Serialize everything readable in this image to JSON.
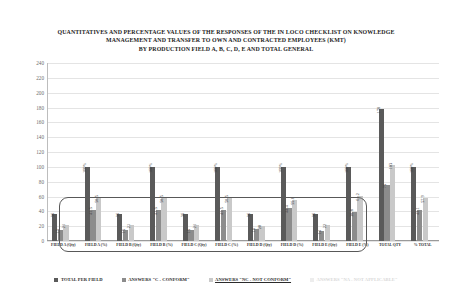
{
  "title": {
    "line1": "QUANTITATIVES AND PERCENTAGE VALUES OF THE RESPONSES OF THE IN LOCO CHECKLIST ON KNOWLEDGE",
    "line2": "MANAGEMENT AND TRANSFER TO OWN AND CONTRACTED EMPLOYEES (KMT)",
    "line3": "BY PRODUCTION FIELD A, B, C, D, E AND TOTAL GENERAL"
  },
  "colors": {
    "total_per_field": "#5a5a5a",
    "conform": "#8c8c8c",
    "not_conform": "#c9c9c9",
    "percent_applicable": "#ededed",
    "gridline": "#e4e4e4",
    "axis": "#9a9a9a",
    "annotation_border": "#585858"
  },
  "chart_data": {
    "type": "bar",
    "xlabel": "",
    "ylabel": "",
    "ylim": [
      0,
      240
    ],
    "yticks": [
      0,
      20,
      40,
      60,
      80,
      100,
      120,
      140,
      160,
      180,
      200,
      220,
      240
    ],
    "grid": true,
    "legend_position": "bottom",
    "categories": [
      "FIELD A (Qty)",
      "FIELD A (%)",
      "FIELD B (Qty)",
      "FIELD B (%)",
      "FIELD C (Qty)",
      "FIELD C (%)",
      "FIELD D (Qty)",
      "FIELD D (%)",
      "FIELD E (Qty)",
      "FIELD E (%)",
      "TOTAL QTY",
      "% TOTAL"
    ],
    "series": [
      {
        "name": "TOTAL PER FIELD",
        "color": "#5a5a5a",
        "values": [
          36,
          100,
          36,
          100,
          36,
          100,
          36,
          100,
          36,
          100,
          178,
          100
        ]
      },
      {
        "name": "ANSWERS \"C - CONFORM\"",
        "color": "#8c8c8c",
        "values": [
          15,
          41.5,
          15,
          41.5,
          15,
          41.5,
          16,
          44.4,
          14,
          38.8,
          75,
          42.1
        ]
      },
      {
        "name": "ANSWERS \"NC - NOT CONFORM\"",
        "color": "#c9c9c9",
        "values": [
          21,
          58.5,
          21,
          58.5,
          21,
          58.5,
          20,
          55.6,
          22,
          61.2,
          103,
          57.9
        ]
      },
      {
        "name": "ANSWERS \"NA - NOT APPLICABLE\"",
        "color": "#ededed",
        "values": [
          0,
          0,
          0,
          0,
          0,
          0,
          0,
          0,
          0,
          0,
          0,
          0
        ]
      }
    ],
    "bar_labels": [
      [
        "36",
        "100%",
        "36",
        "100%",
        "36",
        "100%",
        "36",
        "100%",
        "36",
        "100%",
        "178",
        "100%"
      ],
      [
        "15",
        "41.5",
        "15",
        "41.5",
        "15",
        "41.5",
        "16",
        "44.4",
        "14",
        "38.8",
        "75",
        "42.1"
      ],
      [
        "21",
        "58.5",
        "21",
        "58.5",
        "21",
        "58.5",
        "20",
        "55.6",
        "22",
        "61.2",
        "103",
        "57.9"
      ],
      [
        "",
        "",
        "",
        "",
        "",
        "",
        "",
        "",
        "",
        "",
        "",
        ""
      ]
    ]
  },
  "legend": [
    {
      "label": "TOTAL PER FIELD",
      "color": "#5a5a5a",
      "underline": false
    },
    {
      "label": "ANSWERS \"C - CONFORM\"",
      "color": "#8c8c8c",
      "underline": false
    },
    {
      "label": "ANSWERS \"NC - NOT CONFORM\"",
      "color": "#c9c9c9",
      "underline": true
    },
    {
      "label": "ANSWERS \"NA - NOT APPLICABLE\"",
      "color": "#ededed",
      "underline": false
    }
  ],
  "annotation": {
    "name": "field-groups-highlight"
  }
}
